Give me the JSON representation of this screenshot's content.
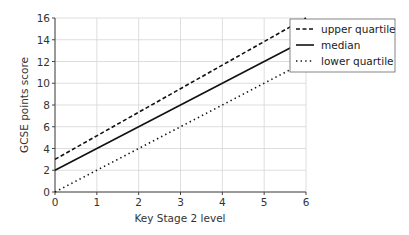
{
  "chart_data": {
    "type": "line",
    "title": "",
    "xlabel": "Key Stage 2 level",
    "ylabel": "GCSE points score",
    "xlim": [
      0,
      6
    ],
    "ylim": [
      0,
      16
    ],
    "x_ticks": [
      "0",
      "1",
      "2",
      "3",
      "4",
      "5",
      "6"
    ],
    "y_ticks": [
      "0",
      "2",
      "4",
      "6",
      "8",
      "10",
      "12",
      "14",
      "16"
    ],
    "grid": true,
    "legend_position": "right-top",
    "x": [
      0,
      6
    ],
    "series": [
      {
        "name": "upper quartile",
        "style": "dashed",
        "values": [
          3,
          16
        ]
      },
      {
        "name": "median",
        "style": "solid",
        "values": [
          2,
          14
        ]
      },
      {
        "name": "lower quartile",
        "style": "dotted",
        "values": [
          0,
          12
        ]
      }
    ]
  }
}
